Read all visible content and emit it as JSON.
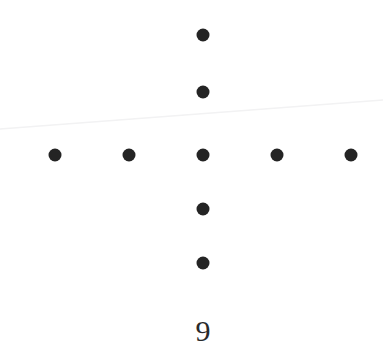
{
  "figure": {
    "background_color": "#ffffff",
    "width": 383,
    "height": 361
  },
  "axis": {
    "x_tick_labels": [
      "9"
    ],
    "x_tick_label_primary": "9",
    "x_tick_label_color": "#2a2a2a",
    "x_tick_label_x": 203,
    "x_tick_label_y": 341
  },
  "trend_line": {
    "name": "regression-line",
    "color": "#f2f2f3",
    "width": 1.6,
    "x1": 0,
    "y1": 129,
    "x2": 383,
    "y2": 100
  },
  "markers": {
    "color": "#242424",
    "radius": 6.5,
    "shape": "circle"
  },
  "chart_data": {
    "type": "scatter",
    "title": "",
    "xlabel": "",
    "ylabel": "",
    "grid": false,
    "legend": null,
    "xlim": [
      0,
      383
    ],
    "ylim": [
      0,
      361
    ],
    "marker_color": "#242424",
    "marker_radius": 6.5,
    "x_tick_labels": [
      "9"
    ],
    "series": [
      {
        "name": "points",
        "points": [
          {
            "label": "top-1",
            "x": 203,
            "y": 35
          },
          {
            "label": "top-2",
            "x": 203,
            "y": 92
          },
          {
            "label": "row-left-2",
            "x": 55,
            "y": 155
          },
          {
            "label": "row-left-1",
            "x": 129,
            "y": 155
          },
          {
            "label": "center",
            "x": 203,
            "y": 155
          },
          {
            "label": "row-right-1",
            "x": 277,
            "y": 155
          },
          {
            "label": "row-right-2",
            "x": 351,
            "y": 155
          },
          {
            "label": "bottom-1",
            "x": 203,
            "y": 209
          },
          {
            "label": "bottom-2",
            "x": 203,
            "y": 263
          }
        ]
      }
    ],
    "annotations": [
      {
        "text": "9",
        "x": 203,
        "y": 341
      }
    ],
    "lines": [
      {
        "name": "trend",
        "x": [
          0,
          383
        ],
        "y": [
          129,
          100
        ],
        "color": "#f2f2f3",
        "width": 1.6
      }
    ]
  }
}
